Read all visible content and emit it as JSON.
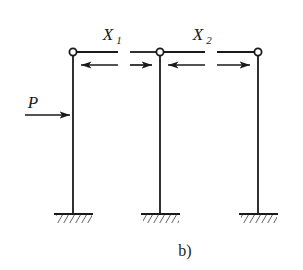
{
  "figure": {
    "caption": "b)"
  },
  "loads": {
    "applied": {
      "symbol": "P",
      "direction": "right",
      "target": "left-column"
    }
  },
  "redundants": [
    {
      "symbol": "X",
      "subscript": "1",
      "span": "left",
      "arrows": [
        "left",
        "right"
      ]
    },
    {
      "symbol": "X",
      "subscript": "2",
      "span": "right",
      "arrows": [
        "left",
        "right"
      ]
    }
  ],
  "columns": [
    {
      "name": "left-column",
      "top_joint": "pin"
    },
    {
      "name": "middle-column",
      "top_joint": "pin"
    },
    {
      "name": "right-column",
      "top_joint": "pin"
    }
  ],
  "supports": [
    {
      "name": "left-support",
      "type": "fixed-hatched"
    },
    {
      "name": "middle-support",
      "type": "fixed-hatched"
    },
    {
      "name": "right-support",
      "type": "fixed-hatched"
    }
  ],
  "geometry": {
    "column_x": [
      73,
      160,
      258
    ],
    "beam_y": 52,
    "arrow_y": 65,
    "ground_y": 214,
    "load_y": 115,
    "gaps": [
      [
        118,
        130
      ],
      [
        205,
        217
      ]
    ]
  },
  "colors": {
    "line": "#1a1a1a",
    "background": "#ffffff"
  }
}
